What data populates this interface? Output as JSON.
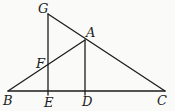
{
  "diagram": {
    "width": 175,
    "height": 111,
    "background": "#fafaf8",
    "stroke_color": "#1c1c1c",
    "stroke_width": 1.3,
    "label_color": "#1c1c1c",
    "segments": [
      {
        "name": "base-BC",
        "x1": 8,
        "y1": 91,
        "x2": 165,
        "y2": 91
      },
      {
        "name": "line-BA",
        "x1": 8,
        "y1": 91,
        "x2": 85,
        "y2": 40
      },
      {
        "name": "line-GC",
        "x1": 48,
        "y1": 14,
        "x2": 165,
        "y2": 91
      },
      {
        "name": "line-GE",
        "x1": 48,
        "y1": 14,
        "x2": 48,
        "y2": 95
      },
      {
        "name": "line-AD",
        "x1": 85,
        "y1": 40,
        "x2": 85,
        "y2": 95
      }
    ],
    "labels": [
      {
        "text": "G",
        "x": 38,
        "y": 13
      },
      {
        "text": "A",
        "x": 86,
        "y": 37
      },
      {
        "text": "F",
        "x": 36,
        "y": 68
      },
      {
        "text": "B",
        "x": 3,
        "y": 105
      },
      {
        "text": "E",
        "x": 44,
        "y": 107
      },
      {
        "text": "D",
        "x": 82,
        "y": 106
      },
      {
        "text": "C",
        "x": 157,
        "y": 105
      }
    ]
  }
}
